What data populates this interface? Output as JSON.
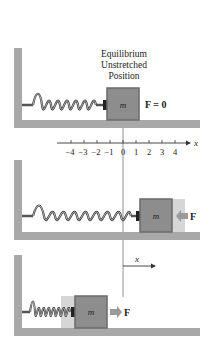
{
  "title_lines": [
    "Equilibrium",
    "Unstretched",
    "Position"
  ],
  "panel1": {
    "block_label": "m",
    "force_label": "F = 0"
  },
  "axis": {
    "label": "x",
    "ticks": [
      "−4",
      "−3",
      "−2",
      "−1",
      "0",
      "1",
      "2",
      "3",
      "4"
    ]
  },
  "panel2": {
    "block_label": "m",
    "force_label": "F",
    "force_direction": "left"
  },
  "displacement": {
    "label": "x"
  },
  "panel3": {
    "block_label": "m",
    "force_label": "F",
    "force_direction": "right"
  },
  "colors": {
    "wall": "#a8a8a8",
    "block_fill": "#8d8d8d",
    "block_edge": "#6a6a6a",
    "ghost": "#d6d6d6",
    "spring": "#333333",
    "arrow": "#9a9a9a"
  }
}
